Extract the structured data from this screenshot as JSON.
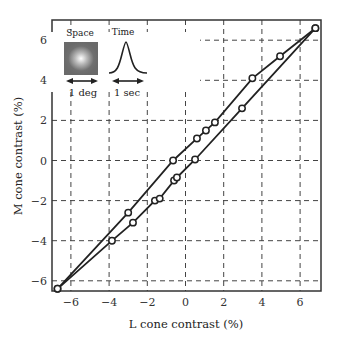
{
  "chart_data": {
    "type": "scatter",
    "title": "",
    "xlabel": "L cone contrast (%)",
    "ylabel": "M cone contrast (%)",
    "xlim": [
      -7.0,
      7.1
    ],
    "ylim": [
      -6.9,
      6.7
    ],
    "xticks": [
      -6,
      -4,
      -2,
      0,
      2,
      4,
      6
    ],
    "yticks": [
      -6,
      -4,
      -2,
      0,
      2,
      4,
      6
    ],
    "xtick_labels": [
      "−6",
      "−4",
      "−2",
      "0",
      "2",
      "4",
      "6"
    ],
    "ytick_labels": [
      "−6",
      "−4",
      "−2",
      "0",
      "2",
      "4",
      "6"
    ],
    "grid": true,
    "grid_style": "dashed",
    "series": [
      {
        "name": "upper branch",
        "x": [
          -6.7,
          -3.0,
          -0.65,
          0.6,
          1.07,
          1.54,
          3.5,
          4.95,
          6.8
        ],
        "y": [
          -6.4,
          -2.6,
          0.0,
          1.1,
          1.5,
          1.9,
          4.1,
          5.2,
          6.6
        ]
      },
      {
        "name": "lower branch",
        "x": [
          -6.7,
          -3.85,
          -2.75,
          -1.6,
          -1.35,
          -0.6,
          -0.45,
          0.5,
          2.96,
          6.8
        ],
        "y": [
          -6.4,
          -4.0,
          -3.1,
          -2.0,
          -1.9,
          -1.0,
          -0.85,
          0.05,
          2.6,
          6.6
        ]
      }
    ],
    "annotations": {
      "inset_space_label": "Space",
      "inset_time_label": "Time",
      "inset_space_scale": "1 deg",
      "inset_time_scale": "1 sec"
    }
  },
  "colors": {
    "line": "#222222",
    "grid": "#444444",
    "inset_bg": "#707070"
  }
}
